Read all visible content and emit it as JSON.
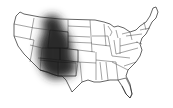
{
  "map": {
    "region": "United States (contiguous)",
    "style": "grayscale outline with state borders",
    "highlight": {
      "description": "dark shaded region over Mountain West",
      "states": [
        "Wyoming",
        "Utah",
        "Colorado",
        "Arizona",
        "New Mexico"
      ],
      "partial_states": [
        "Idaho",
        "Montana",
        "Nevada",
        "Nebraska"
      ],
      "color": "#2a2a2a"
    },
    "colors": {
      "background": "#ffffff",
      "land": "#ffffff",
      "borders": "#222222"
    }
  }
}
